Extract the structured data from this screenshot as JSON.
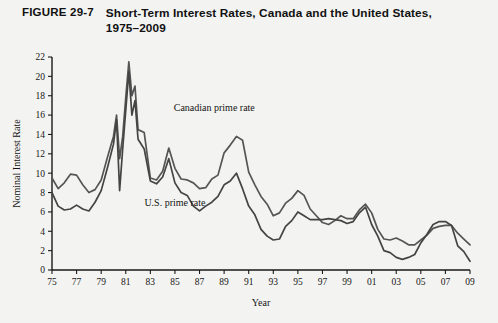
{
  "figure": {
    "number": "FIGURE 29-7",
    "title": "Short-Term Interest Rates, Canada and the United States, 1975–2009"
  },
  "chart_data": {
    "type": "line",
    "title": "Short-Term Interest Rates, Canada and the United States, 1975–2009",
    "xlabel": "Year",
    "ylabel": "Nominal Interest Rate",
    "xlim": [
      1975,
      2009
    ],
    "ylim": [
      0,
      22
    ],
    "ytick_step": 2,
    "xtick_step": 2,
    "grid": false,
    "legend_position": "inline-annotations",
    "ytick_labels": [
      "0",
      "2",
      "4",
      "6",
      "8",
      "10",
      "12",
      "14",
      "16",
      "18",
      "20",
      "22"
    ],
    "xtick_labels": [
      "75",
      "77",
      "79",
      "81",
      "83",
      "85",
      "87",
      "89",
      "91",
      "93",
      "95",
      "97",
      "99",
      "01",
      "03",
      "05",
      "07",
      "09"
    ],
    "annotations": [
      {
        "text": "Canadian prime rate",
        "x": 1988.2,
        "y": 16.4
      },
      {
        "text": "U.S. prime rate",
        "x": 1985.0,
        "y": 6.6
      }
    ],
    "x": [
      1975.0,
      1975.5,
      1976.0,
      1976.5,
      1977.0,
      1977.5,
      1978.0,
      1978.5,
      1979.0,
      1979.5,
      1980.0,
      1980.25,
      1980.5,
      1980.75,
      1981.0,
      1981.25,
      1981.5,
      1981.75,
      1982.0,
      1982.5,
      1983.0,
      1983.5,
      1984.0,
      1984.5,
      1985.0,
      1985.5,
      1986.0,
      1986.5,
      1987.0,
      1987.5,
      1988.0,
      1988.5,
      1989.0,
      1989.5,
      1990.0,
      1990.5,
      1991.0,
      1991.5,
      1992.0,
      1992.5,
      1993.0,
      1993.5,
      1994.0,
      1994.5,
      1995.0,
      1995.5,
      1996.0,
      1996.5,
      1997.0,
      1997.5,
      1998.0,
      1998.5,
      1999.0,
      1999.5,
      2000.0,
      2000.5,
      2001.0,
      2001.5,
      2002.0,
      2002.5,
      2003.0,
      2003.5,
      2004.0,
      2004.5,
      2005.0,
      2005.5,
      2006.0,
      2006.5,
      2007.0,
      2007.5,
      2008.0,
      2008.5,
      2009.0
    ],
    "series": [
      {
        "name": "Canadian prime rate",
        "color": "#555555",
        "values": [
          9.5,
          8.4,
          9.0,
          9.9,
          9.8,
          8.8,
          8.0,
          8.3,
          9.3,
          11.6,
          13.8,
          16.0,
          11.5,
          13.8,
          17.8,
          21.5,
          18.0,
          19.0,
          14.5,
          14.2,
          9.5,
          9.3,
          10.2,
          12.6,
          10.5,
          9.4,
          9.3,
          9.0,
          8.4,
          8.5,
          9.4,
          9.8,
          12.1,
          12.9,
          13.8,
          13.4,
          10.1,
          8.8,
          7.6,
          6.8,
          5.6,
          5.9,
          6.9,
          7.4,
          8.2,
          7.7,
          6.3,
          5.6,
          4.9,
          4.7,
          5.1,
          5.6,
          5.3,
          5.3,
          6.2,
          6.8,
          5.9,
          4.2,
          3.2,
          3.1,
          3.3,
          3.0,
          2.6,
          2.6,
          3.1,
          3.6,
          4.3,
          4.5,
          4.6,
          4.6,
          3.8,
          3.2,
          2.6
        ]
      },
      {
        "name": "U.S. prime rate",
        "color": "#444444",
        "values": [
          8.0,
          6.6,
          6.2,
          6.3,
          6.7,
          6.3,
          6.1,
          7.0,
          8.2,
          10.5,
          13.0,
          15.5,
          8.2,
          12.5,
          16.5,
          20.5,
          16.0,
          17.5,
          13.5,
          12.5,
          9.2,
          8.9,
          9.6,
          11.5,
          9.0,
          8.0,
          7.7,
          6.6,
          6.1,
          6.6,
          7.0,
          7.6,
          8.8,
          9.2,
          10.0,
          8.4,
          6.6,
          5.7,
          4.2,
          3.5,
          3.1,
          3.2,
          4.5,
          5.1,
          6.0,
          5.6,
          5.2,
          5.2,
          5.2,
          5.3,
          5.2,
          5.1,
          4.8,
          5.0,
          5.9,
          6.5,
          4.7,
          3.5,
          2.0,
          1.8,
          1.3,
          1.1,
          1.3,
          1.6,
          2.8,
          3.7,
          4.7,
          5.0,
          5.0,
          4.6,
          2.5,
          1.9,
          0.9
        ]
      }
    ]
  }
}
